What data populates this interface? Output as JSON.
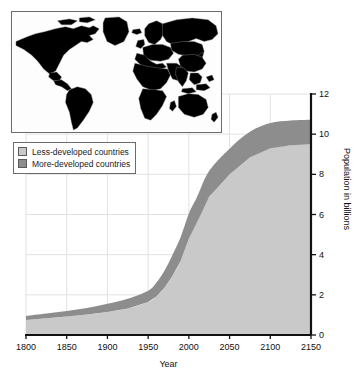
{
  "figure": {
    "background_color": "#ffffff"
  },
  "legend": {
    "items": [
      {
        "label": "Less-developed countries",
        "color": "#c9c9c9"
      },
      {
        "label": "More-developed countries",
        "color": "#8d8d8d"
      }
    ]
  },
  "map_inset": {
    "name": "world-map-inset",
    "less_developed_color": "#d0d0d0",
    "more_developed_color": "#878787",
    "ocean_color": "#fdfdfd",
    "border_color": "#6b6b6b",
    "more_developed_regions": [
      "North America",
      "Greenland",
      "Europe",
      "Scandinavia",
      "Japan",
      "Australia",
      "New Zealand"
    ],
    "less_developed_regions": [
      "South America",
      "Africa",
      "Asia",
      "Russia",
      "Middle East",
      "Southeast Asia"
    ]
  },
  "chart_data": {
    "type": "area",
    "title": "",
    "xlabel": "Year",
    "ylabel": "Population in billions",
    "xlim": [
      1800,
      2150
    ],
    "ylim": [
      0,
      12
    ],
    "xticks": [
      1800,
      1850,
      1900,
      1950,
      2000,
      2050,
      2100,
      2150
    ],
    "yticks": [
      0,
      2,
      4,
      6,
      8,
      10,
      12
    ],
    "grid": true,
    "grid_color": "#e2e2e2",
    "legend_position": "upper-left",
    "stacked": true,
    "x": [
      1800,
      1825,
      1850,
      1875,
      1900,
      1925,
      1950,
      1960,
      1970,
      1980,
      1990,
      2000,
      2010,
      2025,
      2050,
      2075,
      2100,
      2125,
      2150
    ],
    "series": [
      {
        "name": "More-developed countries",
        "color": "#8d8d8d",
        "values": [
          0.2,
          0.24,
          0.28,
          0.33,
          0.4,
          0.48,
          0.56,
          0.68,
          0.85,
          1.05,
          1.18,
          1.25,
          1.27,
          1.28,
          1.28,
          1.27,
          1.25,
          1.23,
          1.22
        ]
      },
      {
        "name": "Less-developed countries",
        "color": "#c9c9c9",
        "values": [
          0.75,
          0.83,
          0.92,
          1.02,
          1.15,
          1.32,
          1.64,
          1.92,
          2.35,
          2.95,
          3.7,
          4.8,
          5.6,
          6.9,
          8.0,
          8.85,
          9.3,
          9.45,
          9.5
        ]
      }
    ],
    "totals": [
      0.95,
      1.07,
      1.2,
      1.35,
      1.55,
      1.8,
      2.2,
      2.6,
      3.2,
      4.0,
      4.88,
      6.05,
      6.87,
      8.18,
      9.28,
      10.12,
      10.55,
      10.68,
      10.72
    ],
    "annotations": []
  }
}
